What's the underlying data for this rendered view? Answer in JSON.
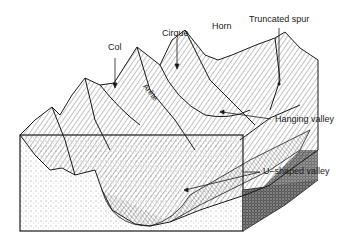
{
  "figure": {
    "labels": {
      "col": "Col",
      "cirque": "Cirque",
      "horn": "Horn",
      "truncated_spur": "Truncated spur",
      "arete": "Arête",
      "hanging_valley": "Hanging valley",
      "u_shaped_valley": "U–shaped valley"
    },
    "colors": {
      "ink": "#1a1a1a",
      "paper": "#ffffff",
      "stipple": "#555555"
    }
  }
}
